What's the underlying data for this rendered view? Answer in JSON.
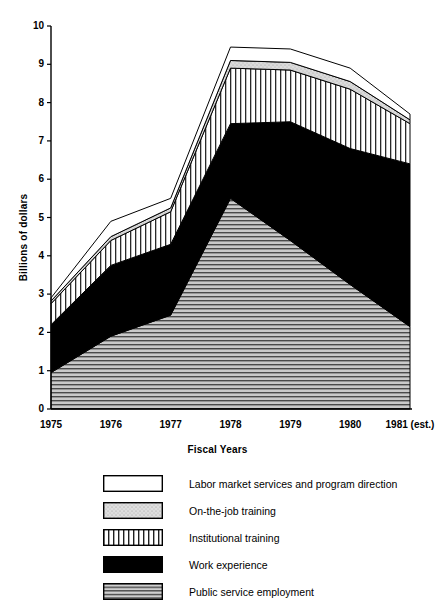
{
  "chart_data": {
    "type": "area",
    "stacked": true,
    "title": "",
    "xlabel": "Fiscal Years",
    "ylabel": "Billions of dollars",
    "ylim": [
      0,
      10
    ],
    "yticks": [
      0,
      1,
      2,
      3,
      4,
      5,
      6,
      7,
      8,
      9,
      10
    ],
    "grid": false,
    "legend_position": "below",
    "categories": [
      "1975",
      "1976",
      "1977",
      "1978",
      "1979",
      "1980",
      "1981 (est.)"
    ],
    "x": [
      1975,
      1976,
      1977,
      1978,
      1979,
      1980,
      1981
    ],
    "series": [
      {
        "name": "Public service employment",
        "pattern": "horizontal-lines",
        "color": "#b8b8b8",
        "values": [
          0.95,
          1.9,
          2.45,
          5.5,
          4.4,
          3.25,
          2.15
        ]
      },
      {
        "name": "Work experience",
        "pattern": "solid-black",
        "color": "#000000",
        "values": [
          1.25,
          1.85,
          1.85,
          1.95,
          3.1,
          3.55,
          4.25
        ]
      },
      {
        "name": "Institutional training",
        "pattern": "vertical-lines",
        "color": "#ffffff",
        "values": [
          0.55,
          0.65,
          0.85,
          1.45,
          1.35,
          1.55,
          1.05
        ]
      },
      {
        "name": "On-the-job training",
        "pattern": "light-stipple",
        "color": "#d0d0d0",
        "values": [
          0.07,
          0.1,
          0.1,
          0.2,
          0.2,
          0.2,
          0.1
        ]
      },
      {
        "name": "Labor market services and program direction",
        "pattern": "blank-white",
        "color": "#ffffff",
        "values": [
          0.08,
          0.4,
          0.25,
          0.35,
          0.35,
          0.35,
          0.15
        ]
      }
    ],
    "cumulative_tops": {
      "public_service_employment": [
        0.95,
        1.9,
        2.45,
        5.5,
        4.4,
        3.25,
        2.15
      ],
      "work_experience": [
        2.2,
        3.75,
        4.3,
        7.45,
        7.5,
        6.8,
        6.4
      ],
      "institutional_training": [
        2.75,
        4.4,
        5.15,
        8.9,
        8.85,
        8.35,
        7.45
      ],
      "on_the_job_training": [
        2.82,
        4.5,
        5.25,
        9.1,
        9.05,
        8.55,
        7.55
      ],
      "total": [
        2.9,
        4.9,
        5.5,
        9.45,
        9.4,
        8.9,
        7.7
      ]
    }
  },
  "legend": {
    "items": [
      {
        "label": "Labor market services and program direction",
        "swatch": "blank-white-swatch"
      },
      {
        "label": "On-the-job training",
        "swatch": "light-stipple-swatch"
      },
      {
        "label": "Institutional training",
        "swatch": "vertical-lines-swatch"
      },
      {
        "label": "Work experience",
        "swatch": "solid-black-swatch"
      },
      {
        "label": "Public service employment",
        "swatch": "horizontal-lines-swatch"
      }
    ]
  },
  "axes": {
    "y_label": "Billions of dollars",
    "x_label": "Fiscal Years",
    "y_ticks": [
      "10",
      "9",
      "8",
      "7",
      "6",
      "5",
      "4",
      "3",
      "2",
      "1",
      "0"
    ],
    "x_ticks": [
      "1975",
      "1976",
      "1977",
      "1978",
      "1979",
      "1980",
      "1981 (est.)"
    ]
  }
}
